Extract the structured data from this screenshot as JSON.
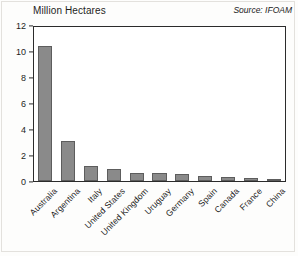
{
  "chart_data": {
    "type": "bar",
    "title": "Million Hectares",
    "xlabel": "",
    "ylabel": "Million Hectares",
    "ylim": [
      0,
      12
    ],
    "yticks": [
      0,
      2,
      4,
      6,
      8,
      10,
      12
    ],
    "ytick_labels": [
      "0",
      "2",
      "4",
      "6",
      "8",
      "10",
      "12"
    ],
    "grid": false,
    "legend": null,
    "annotations": [
      "Source: IFOAM"
    ],
    "bar_color": "#8a8a8a",
    "bar_edge_color": "#5d5d5d",
    "categories": [
      "Australia",
      "Argentina",
      "Italy",
      "United States",
      "United Kingdom",
      "Uruguay",
      "Germany",
      "Spain",
      "Canada",
      "France",
      "China"
    ],
    "values": [
      10.5,
      3.15,
      1.2,
      0.9,
      0.62,
      0.6,
      0.55,
      0.38,
      0.32,
      0.26,
      0.15
    ]
  },
  "source": {
    "label": "Source: IFOAM"
  }
}
